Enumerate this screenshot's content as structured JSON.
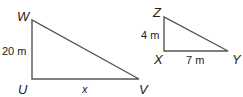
{
  "triangles": [
    {
      "name": "WUV",
      "vertices": {
        "top": "W",
        "right_angle": "U",
        "end": "V"
      },
      "legs": {
        "vertical": "20 m",
        "horizontal": "x"
      }
    },
    {
      "name": "ZXY",
      "vertices": {
        "top": "Z",
        "right_angle": "X",
        "end": "Y"
      },
      "legs": {
        "vertical": "4 m",
        "horizontal": "7 m"
      }
    }
  ]
}
